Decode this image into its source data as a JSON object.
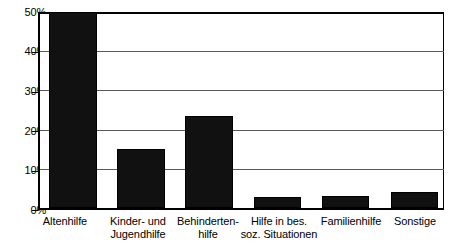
{
  "chart_data": {
    "type": "bar",
    "title": "",
    "subtitle": "",
    "xlabel": "",
    "ylabel": "",
    "categories": [
      "Altenhilfe",
      "Kinder- und\nJugendhilfe",
      "Behinderten-\nhilfe",
      "Hilfe in bes.\nsoz. Situationen",
      "Familienhilfe",
      "Sonstige"
    ],
    "values": [
      50.0,
      15.0,
      23.4,
      2.8,
      3.0,
      4.2
    ],
    "ylim": [
      0,
      50
    ],
    "ytick_labels": [
      "50%",
      "40%",
      "30%",
      "20%",
      "10%",
      "0%"
    ],
    "ytick_values": [
      50,
      40,
      30,
      20,
      10,
      0
    ],
    "grid": true,
    "legend": "none",
    "series": [
      {
        "name": "Anteil",
        "values": [
          50.0,
          15.0,
          23.4,
          2.8,
          3.0,
          4.2
        ]
      }
    ],
    "colors": {
      "bar_fill": "#111111",
      "axis": "#000000",
      "gridline": "#5a5a5a",
      "background": "#ffffff"
    }
  }
}
